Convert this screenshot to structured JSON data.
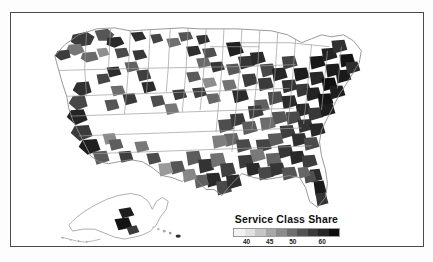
{
  "figure": {
    "background_color": "#fdfdfd",
    "frame_color": "#4a4a4a",
    "map_background": "#ffffff"
  },
  "legend": {
    "title": "Service Class Share",
    "title_color": "#111111",
    "tick_labels": [
      "40",
      "45",
      "50",
      "60"
    ],
    "tick_positions_pct": [
      12,
      34,
      56,
      84
    ],
    "colorbar_colors": [
      "#f2f2f2",
      "#e2e2e2",
      "#c6c6c6",
      "#a8a8a8",
      "#8c8c8c",
      "#6e6e6e",
      "#535353",
      "#3a3a3a",
      "#242424",
      "#0d0d0d"
    ]
  },
  "chart_data": {
    "type": "heatmap",
    "title": "Service Class Share",
    "subtitle": "",
    "xlabel": "",
    "ylabel": "",
    "legend_position": "bottom-center",
    "grid": false,
    "colormap": "grayscale-sequential",
    "value_range": [
      38,
      62
    ],
    "tick_values": [
      40,
      45,
      50,
      60
    ],
    "units": "percent",
    "geography": "United States counties with Alaska and Hawaii insets",
    "regions": [
      {
        "name": "Northeast corridor",
        "value": 60
      },
      {
        "name": "Upper Midwest / Great Lakes",
        "value": 52
      },
      {
        "name": "Pacific Northwest",
        "value": 50
      },
      {
        "name": "California coast",
        "value": 55
      },
      {
        "name": "Mountain West interior",
        "value": 41
      },
      {
        "name": "Great Plains",
        "value": 40
      },
      {
        "name": "Texas metro counties",
        "value": 53
      },
      {
        "name": "Southeast Atlantic",
        "value": 51
      },
      {
        "name": "Florida peninsula",
        "value": 56
      },
      {
        "name": "Alaska - Anchorage area",
        "value": 58
      },
      {
        "name": "Hawaii",
        "value": 54
      }
    ]
  },
  "map": {
    "outline_color": "#8d8d8d",
    "state_border_color": "#9c9c9c",
    "inset_labels": [
      "Alaska",
      "Hawaii"
    ]
  }
}
